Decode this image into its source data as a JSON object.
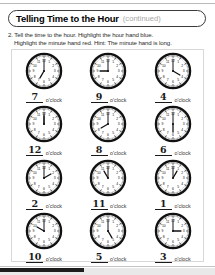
{
  "worksheet": {
    "title_main": "Telling Time to the Hour",
    "title_continued": "(continued)",
    "instruction_line_1": "2. Tell the time to the hour. Highlight the hour hand blue.",
    "instruction_line_2": "Highlight the minute hand red. Hint: The minute hand is long.",
    "answer_word": "o'clock",
    "ink_color": "#1a1a1a",
    "muted_color": "#a8a8a8",
    "frame_color": "#d8d8d8"
  },
  "clocks": [
    {
      "answer": "7",
      "hour": 7,
      "minute": 0
    },
    {
      "answer": "9",
      "hour": 9,
      "minute": 0
    },
    {
      "answer": "4",
      "hour": 4,
      "minute": 0
    },
    {
      "answer": "12",
      "hour": 12,
      "minute": 0
    },
    {
      "answer": "8",
      "hour": 8,
      "minute": 0
    },
    {
      "answer": "6",
      "hour": 6,
      "minute": 0
    },
    {
      "answer": "2",
      "hour": 2,
      "minute": 0
    },
    {
      "answer": "11",
      "hour": 11,
      "minute": 0
    },
    {
      "answer": "1",
      "hour": 1,
      "minute": 0
    },
    {
      "answer": "10",
      "hour": 10,
      "minute": 0
    },
    {
      "answer": "5",
      "hour": 5,
      "minute": 0
    },
    {
      "answer": "3",
      "hour": 3,
      "minute": 0
    }
  ],
  "clock_face": {
    "numerals": [
      "12",
      "1",
      "2",
      "3",
      "4",
      "5",
      "6",
      "7",
      "8",
      "9",
      "10",
      "11"
    ],
    "rim_color": "#111111",
    "hand_color": "#111111",
    "face_color": "#ffffff"
  }
}
